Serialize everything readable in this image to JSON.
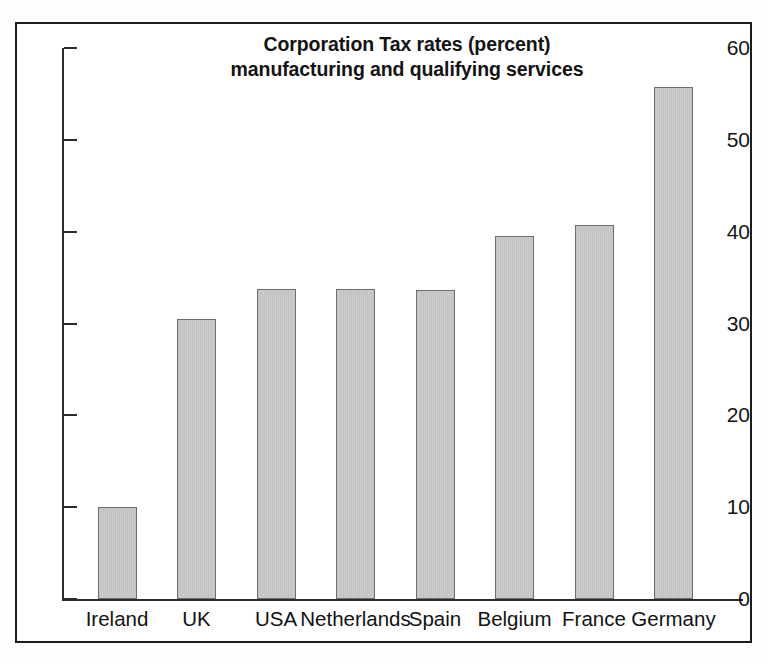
{
  "chart_data": {
    "type": "bar",
    "title": "Corporation Tax rates (percent) manufacturing and qualifying services",
    "title_lines": [
      "Corporation Tax rates (percent)",
      "manufacturing and qualifying services"
    ],
    "xlabel": "",
    "ylabel": "",
    "ylim": [
      0,
      60
    ],
    "ytick_step": 10,
    "yticks": [
      0,
      10,
      20,
      30,
      40,
      50,
      60
    ],
    "ytick_labels": [
      "0",
      "10",
      "20",
      "30",
      "40",
      "50",
      "60"
    ],
    "grid": false,
    "legend": null,
    "categories": [
      "Ireland",
      "UK",
      "USA",
      "Netherlands",
      "Spain",
      "Belgium",
      "France",
      "Germany"
    ],
    "values": [
      10,
      30.5,
      33.8,
      33.8,
      33.7,
      39.5,
      40.7,
      55.8
    ],
    "bar_color": "#c9c9c9",
    "bar_edge_color": "#6e6e6e",
    "axis_color": "#2b2b2b",
    "background_color": "#ffffff",
    "frame_color": "#1d1d1d"
  }
}
